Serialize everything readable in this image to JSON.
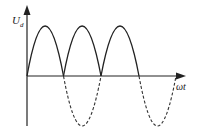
{
  "diagram": {
    "type": "waveform",
    "y_axis_label": "U",
    "y_axis_label_subscript": "d",
    "x_axis_label": "ωt",
    "colors": {
      "line": "#222222",
      "background": "#ffffff"
    },
    "solid_humps": 3,
    "dashed_troughs": 2
  }
}
